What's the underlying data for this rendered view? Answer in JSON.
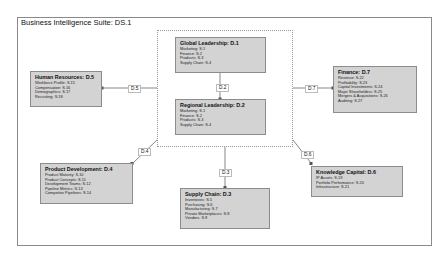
{
  "diagram": {
    "title": "Business Intelligence Suite: DS.1",
    "nodes": [
      {
        "id": "global",
        "title": "Global Leadership: D.1",
        "items": [
          "Marketing: S.1",
          "Finance: S.2",
          "Products: S.3",
          "Supply Chain: S.4"
        ]
      },
      {
        "id": "regional",
        "title": "Regional Leadership: D.2",
        "items": [
          "Marketing: S.1",
          "Finance: S.2",
          "Products: S.3",
          "Supply Chain: S.4"
        ]
      },
      {
        "id": "hr",
        "title": "Human Resources: D.5",
        "items": [
          "Workforce Profile: S.15",
          "Compensation: S.16",
          "Demographics: S.17",
          "Recruiting: S.18"
        ]
      },
      {
        "id": "finance",
        "title": "Finance: D.7",
        "items": [
          "Revenue: S.22",
          "Profitability: S.23",
          "Capital Investments: S.24",
          "Major Shareholders: S.25",
          "Mergers & Acquisitions: S.26",
          "Auditing: S.27"
        ]
      },
      {
        "id": "product",
        "title": "Product Development: D.4",
        "items": [
          "Product Maturity: S.10",
          "Product Concepts: S.11",
          "Development Teams: S.12",
          "Pipeline Metrics: S.13",
          "Competitor Pipelines: S.14"
        ]
      },
      {
        "id": "supply",
        "title": "Supply Chain: D.3",
        "items": [
          "Inventories: S.5",
          "Purchasing: S.6",
          "Manufacturing: S.7",
          "Private Marketplaces: S.8",
          "Vendors: S.9"
        ]
      },
      {
        "id": "knowledge",
        "title": "Knowledge Capital: D.6",
        "items": [
          "IP Assets: S.19",
          "Portfolio Performance: S.20",
          "Infrastructure: S.21"
        ]
      }
    ],
    "edges": [
      {
        "label": "D.2",
        "from": "global",
        "to": "regional"
      },
      {
        "label": "D.5",
        "from": "group",
        "to": "hr"
      },
      {
        "label": "D.7",
        "from": "group",
        "to": "finance"
      },
      {
        "label": "D.4",
        "from": "group",
        "to": "product"
      },
      {
        "label": "D.3",
        "from": "group",
        "to": "supply"
      },
      {
        "label": "D.6",
        "from": "group",
        "to": "knowledge"
      }
    ],
    "colors": {
      "node_fill": "#d3d3d3",
      "node_border": "#8c8c8c",
      "frame_border": "#8a8a8a"
    }
  }
}
